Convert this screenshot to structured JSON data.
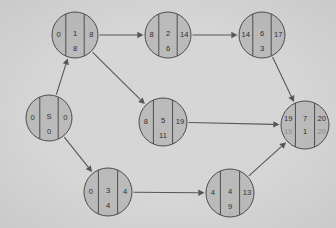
{
  "chart_data": {
    "type": "diagram",
    "title": "",
    "subtitle": "",
    "diagram_kind": "activity-on-node project network / CPM schedule graph",
    "background_color": "#d9d9d9",
    "node_fill_color": "#bdbdbd",
    "node_stroke_color": "#4a4a4a",
    "edge_color": "#555555",
    "text_color": "#2b2b2b",
    "dim_text_color": "#8d8d8d",
    "node_cell_layout": "left column = early start, middle column top = activity label, middle column bottom = duration, right column = early finish",
    "nodes": [
      {
        "id": "start",
        "label": "S",
        "cx": 49,
        "cy": 118,
        "r": 23,
        "left": "0",
        "center_top": "S",
        "center_bottom": "0",
        "right": "0",
        "has_second_row": false
      },
      {
        "id": "n1",
        "label": "1",
        "cx": 75,
        "cy": 35,
        "r": 23,
        "left": "0",
        "center_top": "1",
        "center_bottom": "8",
        "right": "8",
        "has_second_row": false
      },
      {
        "id": "n2",
        "label": "2",
        "cx": 168,
        "cy": 35,
        "r": 23,
        "left": "8",
        "center_top": "2",
        "center_bottom": "6",
        "right": "14",
        "has_second_row": false
      },
      {
        "id": "n6",
        "label": "6",
        "cx": 262,
        "cy": 35,
        "r": 23,
        "left": "14",
        "center_top": "6",
        "center_bottom": "3",
        "right": "17",
        "has_second_row": false
      },
      {
        "id": "n5",
        "label": "5",
        "cx": 163,
        "cy": 122,
        "r": 24,
        "left": "8",
        "center_top": "5",
        "center_bottom": "11",
        "right": "19",
        "has_second_row": false
      },
      {
        "id": "n7",
        "label": "7",
        "cx": 305,
        "cy": 125,
        "r": 24,
        "left": "19",
        "center_top": "7",
        "center_bottom": "1",
        "right": "20",
        "has_second_row": true,
        "second_left": "19",
        "second_center": "1",
        "second_right": "20"
      },
      {
        "id": "n3",
        "label": "3",
        "cx": 108,
        "cy": 192,
        "r": 24,
        "left": "0",
        "center_top": "3",
        "center_bottom": "4",
        "right": "4",
        "has_second_row": false
      },
      {
        "id": "n4",
        "label": "4",
        "cx": 230,
        "cy": 193,
        "r": 24,
        "left": "4",
        "center_top": "4",
        "center_bottom": "9",
        "right": "13",
        "has_second_row": false
      }
    ],
    "edges": [
      {
        "from": "start",
        "to": "n1",
        "label": ""
      },
      {
        "from": "start",
        "to": "n3",
        "label": ""
      },
      {
        "from": "n1",
        "to": "n2",
        "label": ""
      },
      {
        "from": "n1",
        "to": "n5",
        "label": ""
      },
      {
        "from": "n2",
        "to": "n6",
        "label": ""
      },
      {
        "from": "n6",
        "to": "n7",
        "label": ""
      },
      {
        "from": "n5",
        "to": "n7",
        "label": ""
      },
      {
        "from": "n3",
        "to": "n4",
        "label": ""
      },
      {
        "from": "n4",
        "to": "n7",
        "label": ""
      }
    ]
  }
}
